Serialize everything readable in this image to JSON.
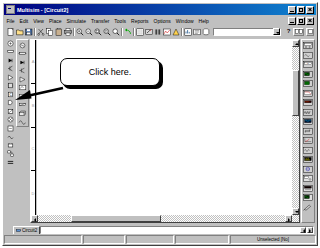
{
  "window": {
    "title": "Multisim - [Circuit2]",
    "app_icon": "multisim-icon",
    "buttons": {
      "minimize": "_",
      "maximize": "□",
      "close": "×"
    }
  },
  "menubar": {
    "items": [
      {
        "label": "File"
      },
      {
        "label": "Edit"
      },
      {
        "label": "View"
      },
      {
        "label": "Place"
      },
      {
        "label": "Simulate"
      },
      {
        "label": "Transfer"
      },
      {
        "label": "Tools"
      },
      {
        "label": "Reports"
      },
      {
        "label": "Options"
      },
      {
        "label": "Window"
      },
      {
        "label": "Help"
      }
    ]
  },
  "toolbar": {
    "buttons": [
      {
        "name": "new",
        "icon": "new-document-icon"
      },
      {
        "name": "open",
        "icon": "open-folder-icon"
      },
      {
        "name": "save",
        "icon": "save-disk-icon"
      },
      {
        "name": "print",
        "icon": "printer-icon"
      },
      {
        "name": "print-preview",
        "icon": "print-preview-icon"
      },
      {
        "name": "cut",
        "icon": "scissors-icon"
      },
      {
        "name": "copy",
        "icon": "copy-icon"
      },
      {
        "name": "paste",
        "icon": "clipboard-icon"
      },
      {
        "name": "undo",
        "icon": "undo-arrow-icon"
      },
      {
        "name": "zoom-in",
        "icon": "magnifier-plus-icon"
      },
      {
        "name": "zoom-out",
        "icon": "magnifier-minus-icon"
      },
      {
        "name": "zoom-area",
        "icon": "magnifier-area-icon"
      },
      {
        "name": "zoom-fit",
        "icon": "magnifier-fit-icon"
      },
      {
        "name": "zoom-full",
        "icon": "magnifier-full-icon"
      },
      {
        "name": "toggle-grid",
        "icon": "grid-icon"
      },
      {
        "name": "run-simulation",
        "icon": "run-switch-icon"
      },
      {
        "name": "pause-simulation",
        "icon": "pause-icon"
      },
      {
        "name": "grapher",
        "icon": "grapher-icon"
      },
      {
        "name": "postprocessor",
        "icon": "postprocessor-icon"
      },
      {
        "name": "analysis",
        "icon": "analysis-icon"
      },
      {
        "name": "in-use-list",
        "icon": "in-use-list-icon"
      },
      {
        "name": "database",
        "icon": "database-icon"
      }
    ],
    "combo_value": "",
    "combo_placeholder": "",
    "help_label": "?",
    "right_buttons": [
      {
        "name": "component-browser",
        "icon": "component-browser-icon"
      },
      {
        "name": "help-context",
        "icon": "context-help-icon"
      }
    ]
  },
  "left_toolbar_primary": {
    "name": "design-toolbar",
    "buttons": [
      {
        "icon": "place-source-icon"
      },
      {
        "icon": "place-basic-icon"
      },
      {
        "icon": "place-diode-icon"
      },
      {
        "icon": "place-transistor-icon"
      },
      {
        "icon": "place-analog-icon"
      },
      {
        "icon": "place-ttl-icon"
      },
      {
        "icon": "place-cmos-icon"
      },
      {
        "icon": "place-misc-digital-icon"
      },
      {
        "icon": "place-mixed-icon"
      },
      {
        "icon": "place-indicator-icon"
      },
      {
        "icon": "place-misc-icon"
      },
      {
        "icon": "place-rf-icon"
      },
      {
        "icon": "place-electromech-icon"
      },
      {
        "icon": "place-hierarchical-icon"
      },
      {
        "icon": "place-bus-icon"
      }
    ]
  },
  "left_toolbar_parts": {
    "name": "virtual-components-toolbar",
    "buttons": [
      {
        "icon": "virtual-source-icon"
      },
      {
        "icon": "virtual-basic-icon"
      },
      {
        "icon": "virtual-diode-icon"
      },
      {
        "icon": "virtual-transistor-icon"
      },
      {
        "icon": "virtual-analog-icon"
      },
      {
        "icon": "virtual-measurement-icon"
      },
      {
        "icon": "virtual-misc-icon"
      },
      {
        "icon": "virtual-rated-icon"
      },
      {
        "icon": "virtual-3d-icon"
      },
      {
        "icon": "virtual-signal-icon"
      }
    ]
  },
  "right_toolbar": {
    "name": "instruments-toolbar",
    "buttons": [
      {
        "icon": "multimeter-icon"
      },
      {
        "icon": "function-generator-icon"
      },
      {
        "icon": "wattmeter-icon"
      },
      {
        "icon": "oscilloscope-icon"
      },
      {
        "icon": "four-channel-oscilloscope-icon"
      },
      {
        "icon": "bode-plotter-icon"
      },
      {
        "icon": "frequency-counter-icon"
      },
      {
        "icon": "word-generator-icon"
      },
      {
        "icon": "logic-analyzer-icon"
      },
      {
        "icon": "logic-converter-icon"
      },
      {
        "icon": "iv-analyzer-icon"
      },
      {
        "icon": "distortion-analyzer-icon"
      },
      {
        "icon": "spectrum-analyzer-icon"
      },
      {
        "icon": "network-analyzer-icon"
      },
      {
        "icon": "agilent-function-generator-icon"
      },
      {
        "icon": "agilent-multimeter-icon"
      },
      {
        "icon": "agilent-oscilloscope-icon"
      },
      {
        "icon": "dynamic-measurement-probe-icon"
      }
    ]
  },
  "document": {
    "ruler_labels": [
      "A",
      "B",
      "C",
      "D"
    ],
    "canvas_background": "#ffffff"
  },
  "tabs": {
    "items": [
      {
        "label": "Circuit2",
        "icon": "circuit-tab-icon",
        "active": true
      }
    ],
    "nav_prev": "◀",
    "nav_next": "▶"
  },
  "statusbar": {
    "panels": [
      {
        "name": "message",
        "text": ""
      },
      {
        "name": "panel-2",
        "text": ""
      },
      {
        "name": "panel-3",
        "text": ""
      },
      {
        "name": "panel-4",
        "text": ""
      },
      {
        "name": "selection-info",
        "text": "Unselected [No]"
      }
    ]
  },
  "callout": {
    "text": "Click here.",
    "pointer_target": "left-toolbar",
    "border_color": "#000000",
    "fill_color": "#ffffff",
    "shadow_color": "#000000"
  },
  "colors": {
    "titlebar_start": "#000080",
    "titlebar_end": "#1084d0",
    "face": "#c0c0c0",
    "canvas": "#ffffff",
    "shadow": "#808080"
  }
}
